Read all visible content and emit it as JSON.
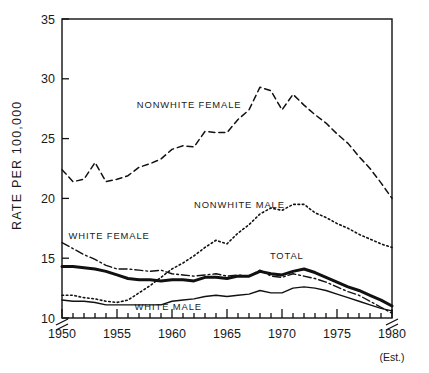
{
  "chart_data": {
    "type": "line",
    "title": "",
    "xlabel": "",
    "ylabel": "RATE PER 100,000",
    "xlim": [
      1950,
      1980
    ],
    "ylim": [
      10,
      35
    ],
    "yticks": [
      10,
      15,
      20,
      25,
      30,
      35
    ],
    "xticks": [
      1950,
      1955,
      1960,
      1965,
      1970,
      1975,
      1980
    ],
    "xtick_labels": [
      "1950",
      "1955",
      "1960",
      "1965",
      "1970",
      "1975",
      "1980"
    ],
    "x_minor_tick_interval": 1,
    "axis_break": "y-axis broken below 10",
    "grid": false,
    "legend": "inline annotations",
    "x_last_note": "(Est.)",
    "x": [
      1950,
      1951,
      1952,
      1953,
      1954,
      1955,
      1956,
      1957,
      1958,
      1959,
      1960,
      1961,
      1962,
      1963,
      1964,
      1965,
      1966,
      1967,
      1968,
      1969,
      1970,
      1971,
      1972,
      1973,
      1974,
      1975,
      1976,
      1977,
      1978,
      1979,
      1980
    ],
    "series": [
      {
        "name": "NONWHITE FEMALE",
        "style": "dashed",
        "label_x": 1956.8,
        "label_y": 27.6,
        "values": [
          22.4,
          21.4,
          21.6,
          23.0,
          21.4,
          21.6,
          21.9,
          22.6,
          22.9,
          23.3,
          24.1,
          24.4,
          24.3,
          25.6,
          25.5,
          25.5,
          26.6,
          27.4,
          29.3,
          29.0,
          27.4,
          28.7,
          27.8,
          27.0,
          26.3,
          25.4,
          24.6,
          23.5,
          22.5,
          21.3,
          20.0
        ]
      },
      {
        "name": "NONWHITE MALE",
        "style": "dotted",
        "label_x": 1962.0,
        "label_y": 19.2,
        "values": [
          11.9,
          11.9,
          11.7,
          11.6,
          11.4,
          11.3,
          11.5,
          12.1,
          12.7,
          13.4,
          14.1,
          14.6,
          15.2,
          15.9,
          16.5,
          16.2,
          17.1,
          17.8,
          18.7,
          19.2,
          19.0,
          19.5,
          19.5,
          18.8,
          18.4,
          17.9,
          17.5,
          17.0,
          16.6,
          16.2,
          15.9
        ]
      },
      {
        "name": "WHITE FEMALE",
        "style": "dashdot",
        "label_x": 1950.6,
        "label_y": 16.6,
        "values": [
          16.3,
          15.8,
          15.3,
          14.9,
          14.4,
          14.1,
          14.1,
          14.0,
          13.9,
          14.0,
          13.7,
          13.6,
          13.5,
          13.6,
          13.7,
          13.5,
          13.6,
          13.5,
          14.0,
          13.5,
          13.4,
          13.7,
          13.5,
          13.3,
          13.0,
          12.6,
          12.2,
          11.9,
          11.4,
          10.9,
          10.4
        ]
      },
      {
        "name": "TOTAL",
        "style": "solid-thick",
        "label_x": 1968.9,
        "label_y": 14.9,
        "values": [
          14.3,
          14.3,
          14.2,
          14.1,
          13.9,
          13.6,
          13.3,
          13.2,
          13.2,
          13.1,
          13.2,
          13.2,
          13.1,
          13.4,
          13.4,
          13.3,
          13.5,
          13.5,
          13.9,
          13.7,
          13.6,
          13.9,
          14.1,
          13.8,
          13.4,
          13.0,
          12.6,
          12.3,
          11.9,
          11.5,
          11.0
        ]
      },
      {
        "name": "WHITE MALE",
        "style": "solid-thin",
        "label_x": 1956.6,
        "label_y": 10.7,
        "values": [
          11.5,
          11.4,
          11.4,
          11.3,
          11.1,
          11.1,
          11.1,
          11.1,
          11.1,
          11.1,
          11.4,
          11.5,
          11.6,
          11.8,
          11.9,
          11.8,
          11.9,
          12.0,
          12.3,
          12.1,
          12.1,
          12.5,
          12.6,
          12.5,
          12.3,
          12.0,
          11.7,
          11.4,
          11.1,
          10.8,
          10.6
        ]
      }
    ]
  },
  "axis": {
    "ylabel": "RATE PER 100,000",
    "est_note": "(Est.)"
  }
}
